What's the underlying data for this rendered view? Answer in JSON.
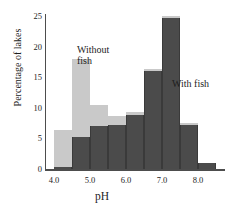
{
  "chart_data": {
    "type": "bar",
    "title": "",
    "subtitle": "",
    "xlabel": "pH",
    "ylabel": "Percentage of lakes",
    "xlim": [
      3.75,
      8.75
    ],
    "ylim": [
      0,
      26
    ],
    "grid": false,
    "legend_position": "in-plot-annotations",
    "bin_width": 0.5,
    "categories": [
      "4.0-4.5",
      "4.5-5.0",
      "5.0-5.5",
      "5.5-6.0",
      "6.0-6.5",
      "6.5-7.0",
      "7.0-7.5",
      "7.5-8.0",
      "8.0-8.5"
    ],
    "bin_starts": [
      4.0,
      4.5,
      5.0,
      5.5,
      6.0,
      6.5,
      7.0,
      7.5,
      8.0
    ],
    "x_tick_labels": [
      "4.0",
      "5.0",
      "6.0",
      "7.0",
      "8.0"
    ],
    "x_tick_values": [
      4.0,
      5.0,
      6.0,
      7.0,
      8.0
    ],
    "y_tick_labels": [
      "0",
      "5",
      "10",
      "15",
      "20",
      "25"
    ],
    "y_tick_values": [
      0,
      5,
      10,
      15,
      20,
      25
    ],
    "series": [
      {
        "name": "Without fish",
        "color": "#c9c9c9",
        "values": [
          6.3,
          18.0,
          10.5,
          8.7,
          9.3,
          16.3,
          25.0,
          7.5,
          1.0
        ]
      },
      {
        "name": "With fish",
        "color": "#4b4b4b",
        "values": [
          0.3,
          5.2,
          7.1,
          7.2,
          8.8,
          16.0,
          24.6,
          7.2,
          1.0
        ]
      }
    ],
    "annotations": [
      {
        "text": "Without fish",
        "series": "Without fish"
      },
      {
        "text": "With fish",
        "series": "With fish"
      }
    ]
  }
}
